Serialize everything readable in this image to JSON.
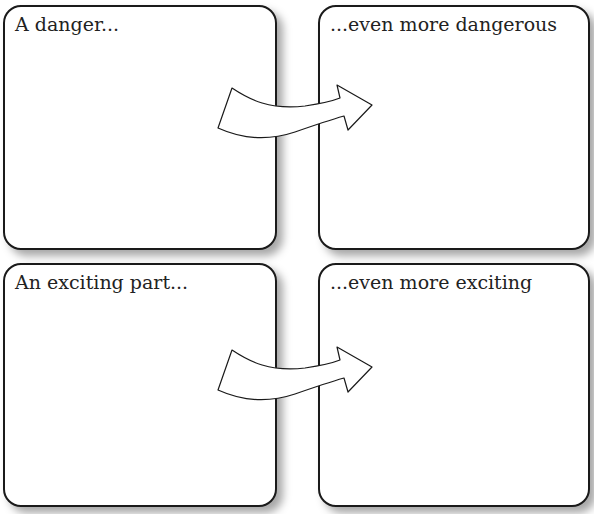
{
  "diagram": {
    "boxes": [
      {
        "id": "top-left",
        "label": "A danger..."
      },
      {
        "id": "top-right",
        "label": "...even more dangerous"
      },
      {
        "id": "bottom-left",
        "label": "An exciting part..."
      },
      {
        "id": "bottom-right",
        "label": "...even more exciting"
      }
    ],
    "arrows": [
      {
        "from": "top-left",
        "to": "top-right",
        "icon": "curved-arrow-right-icon"
      },
      {
        "from": "bottom-left",
        "to": "bottom-right",
        "icon": "curved-arrow-right-icon"
      }
    ],
    "colors": {
      "border": "#1a1a1a",
      "text": "#222222",
      "fill": "#ffffff"
    }
  }
}
